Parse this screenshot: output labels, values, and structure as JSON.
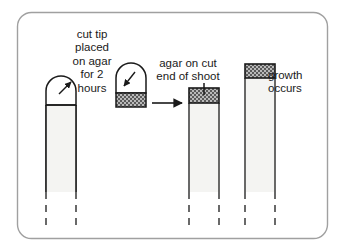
{
  "figure": {
    "frame": {
      "shape": "rounded-rectangle",
      "border_color": "#a0a0a0",
      "background_color": "#ffffff"
    },
    "labels": {
      "cut_tip": "cut tip\nplaced\non agar\nfor 2\nhours",
      "agar_on_cut": "agar on cut\nend of shoot",
      "growth": "growth\noccurs"
    },
    "stages": [
      {
        "id": "stage-1-intact-shoot",
        "name": "intact shoot with dome tip being cut",
        "has_dome_tip": true,
        "has_cut_line": true,
        "has_agar_block": false,
        "arrow": "up-right-from-tip"
      },
      {
        "id": "stage-2-tip-on-agar",
        "name": "cut tip placed on agar block",
        "has_dome_tip": true,
        "has_agar_block": true,
        "arrow": "down-left-into-tip"
      },
      {
        "id": "stage-3-agar-on-shoot",
        "name": "agar block placed on cut end of shoot",
        "has_dome_tip": false,
        "has_agar_block": true,
        "agar_position": "top",
        "leader_line": true
      },
      {
        "id": "stage-4-growth",
        "name": "shoot with agar grows taller",
        "has_dome_tip": false,
        "has_agar_block": true,
        "agar_position": "top",
        "taller": true
      }
    ],
    "transition_arrow": {
      "direction": "right",
      "from_stage": "stage-2-tip-on-agar",
      "to_stage": "stage-3-agar-on-shoot"
    },
    "colors": {
      "outline": "#1a1a1a",
      "stem_fill": "#f4f4f2",
      "agar_fill": "#b9b9b9",
      "agar_stipple": "#4d4d4d",
      "frame": "#a0a0a0",
      "text": "#1a1a1a"
    }
  }
}
